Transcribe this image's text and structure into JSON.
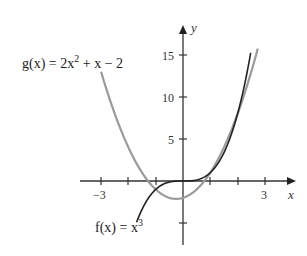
{
  "chart_data": {
    "type": "line",
    "title": "",
    "xlabel": "x",
    "ylabel": "y",
    "xlim": [
      -3.4,
      4.1
    ],
    "ylim": [
      -7.5,
      18
    ],
    "x_ticks": [
      -3,
      -2,
      -1,
      1,
      2,
      3
    ],
    "x_tick_labels": [
      "−3",
      "3"
    ],
    "y_ticks": [
      -5,
      5,
      10,
      15
    ],
    "y_tick_labels": [
      "5",
      "10",
      "15"
    ],
    "grid": false,
    "legend": "none (inline function labels)",
    "series": [
      {
        "name": "g(x) = 2x² + x − 2",
        "color": "#9a9a9a",
        "formula": "2x^2 + x - 2",
        "domain": [
          -3,
          2.74
        ],
        "points": [
          [
            -3,
            13
          ],
          [
            -2,
            4
          ],
          [
            -1,
            -1
          ],
          [
            -0.25,
            -2.13
          ],
          [
            0,
            -2
          ],
          [
            1,
            1
          ],
          [
            2,
            8
          ],
          [
            2.74,
            15.8
          ]
        ]
      },
      {
        "name": "f(x) = x³",
        "color": "#222222",
        "formula": "x^3",
        "domain": [
          -1.7,
          2.48
        ],
        "points": [
          [
            -1.7,
            -4.9
          ],
          [
            -1,
            -1
          ],
          [
            0,
            0
          ],
          [
            1,
            1
          ],
          [
            2,
            8
          ],
          [
            2.48,
            15.3
          ]
        ]
      }
    ],
    "annotations": [
      {
        "text": "g(x) = 2x² + x − 2",
        "position": "upper left, near start of g"
      },
      {
        "text": "f(x) = x³",
        "position": "bottom, below start of f"
      }
    ],
    "intersections_approx": [
      [
        -1.24,
        -1.9
      ],
      [
        1,
        1
      ],
      [
        1.62,
        4.26
      ]
    ]
  },
  "labels": {
    "g_label_prefix": "g(x) = 2x",
    "g_label_exp": "2",
    "g_label_suffix": " + x − 2",
    "f_label_prefix": "f(x) = x",
    "f_label_exp": "3",
    "x_axis": "x",
    "y_axis": "y",
    "tick_neg3": "−3",
    "tick_3": "3",
    "tick_5": "5",
    "tick_10": "10",
    "tick_15": "15"
  }
}
